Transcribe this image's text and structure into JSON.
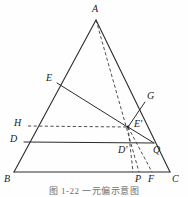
{
  "figure": {
    "caption": "图 1-22   一元偏示意图",
    "line_color": "#2b2b2b",
    "label_color": "#1a1a1a",
    "background": "#fefefe",
    "width": 188,
    "height": 197
  },
  "points": {
    "A": {
      "label": "A",
      "x": 96,
      "y": 20,
      "label_x": 92,
      "label_y": 4,
      "on": "apex"
    },
    "B": {
      "label": "B",
      "x": 14,
      "y": 172,
      "label_x": 4,
      "label_y": 174,
      "on": "base-left"
    },
    "C": {
      "label": "C",
      "x": 170,
      "y": 172,
      "label_x": 172,
      "label_y": 174,
      "on": "base-right"
    },
    "E": {
      "label": "E",
      "x": 57,
      "y": 83,
      "label_x": 46,
      "label_y": 73,
      "on": "side-AB"
    },
    "H": {
      "label": "H",
      "x": 28,
      "y": 126,
      "label_x": 14,
      "label_y": 118,
      "on": "side-AB"
    },
    "D": {
      "label": "D",
      "x": 24,
      "y": 142,
      "label_x": 10,
      "label_y": 134,
      "on": "side-AB"
    },
    "G": {
      "label": "G",
      "x": 145,
      "y": 102,
      "label_x": 147,
      "label_y": 91,
      "on": "side-AC"
    },
    "Q": {
      "label": "Q",
      "x": 153,
      "y": 143,
      "label_x": 153,
      "label_y": 145,
      "on": "interior"
    },
    "Ep": {
      "label": "E",
      "prime": true,
      "x": 128,
      "y": 127,
      "label_x": 134,
      "label_y": 119,
      "on": "interior"
    },
    "Dp": {
      "label": "D",
      "prime": true,
      "x": 131,
      "y": 150,
      "label_x": 118,
      "label_y": 145,
      "on": "interior"
    },
    "P": {
      "label": "P",
      "x": 139,
      "y": 172,
      "label_x": 135,
      "label_y": 174,
      "on": "base"
    },
    "F": {
      "label": "F",
      "x": 152,
      "y": 172,
      "label_x": 148,
      "label_y": 174,
      "on": "base"
    }
  },
  "segments": {
    "solid": [
      {
        "name": "side-AB",
        "from": "A",
        "to": "B"
      },
      {
        "name": "side-AC",
        "from": "A",
        "to": "C"
      },
      {
        "name": "base-BC",
        "from": "B",
        "to": "C"
      },
      {
        "name": "seg-E-Ep",
        "from": "E",
        "to": "Ep"
      },
      {
        "name": "seg-Ep-Q",
        "from": "Ep",
        "to": "Q"
      },
      {
        "name": "seg-D-Q",
        "from": "D",
        "to": "Q"
      },
      {
        "name": "seg-G-Ep",
        "from": "G",
        "to": "Ep"
      }
    ],
    "dashed": [
      {
        "name": "seg-A-Ep-P",
        "from": "A",
        "to": "P",
        "via": "Ep"
      },
      {
        "name": "seg-H-Ep",
        "from": "H",
        "to": "Ep"
      },
      {
        "name": "seg-Ep-F",
        "from": "Ep",
        "to": "F"
      },
      {
        "name": "seg-Ep-Dp-base",
        "from": "Ep",
        "to": "Dp"
      }
    ]
  }
}
